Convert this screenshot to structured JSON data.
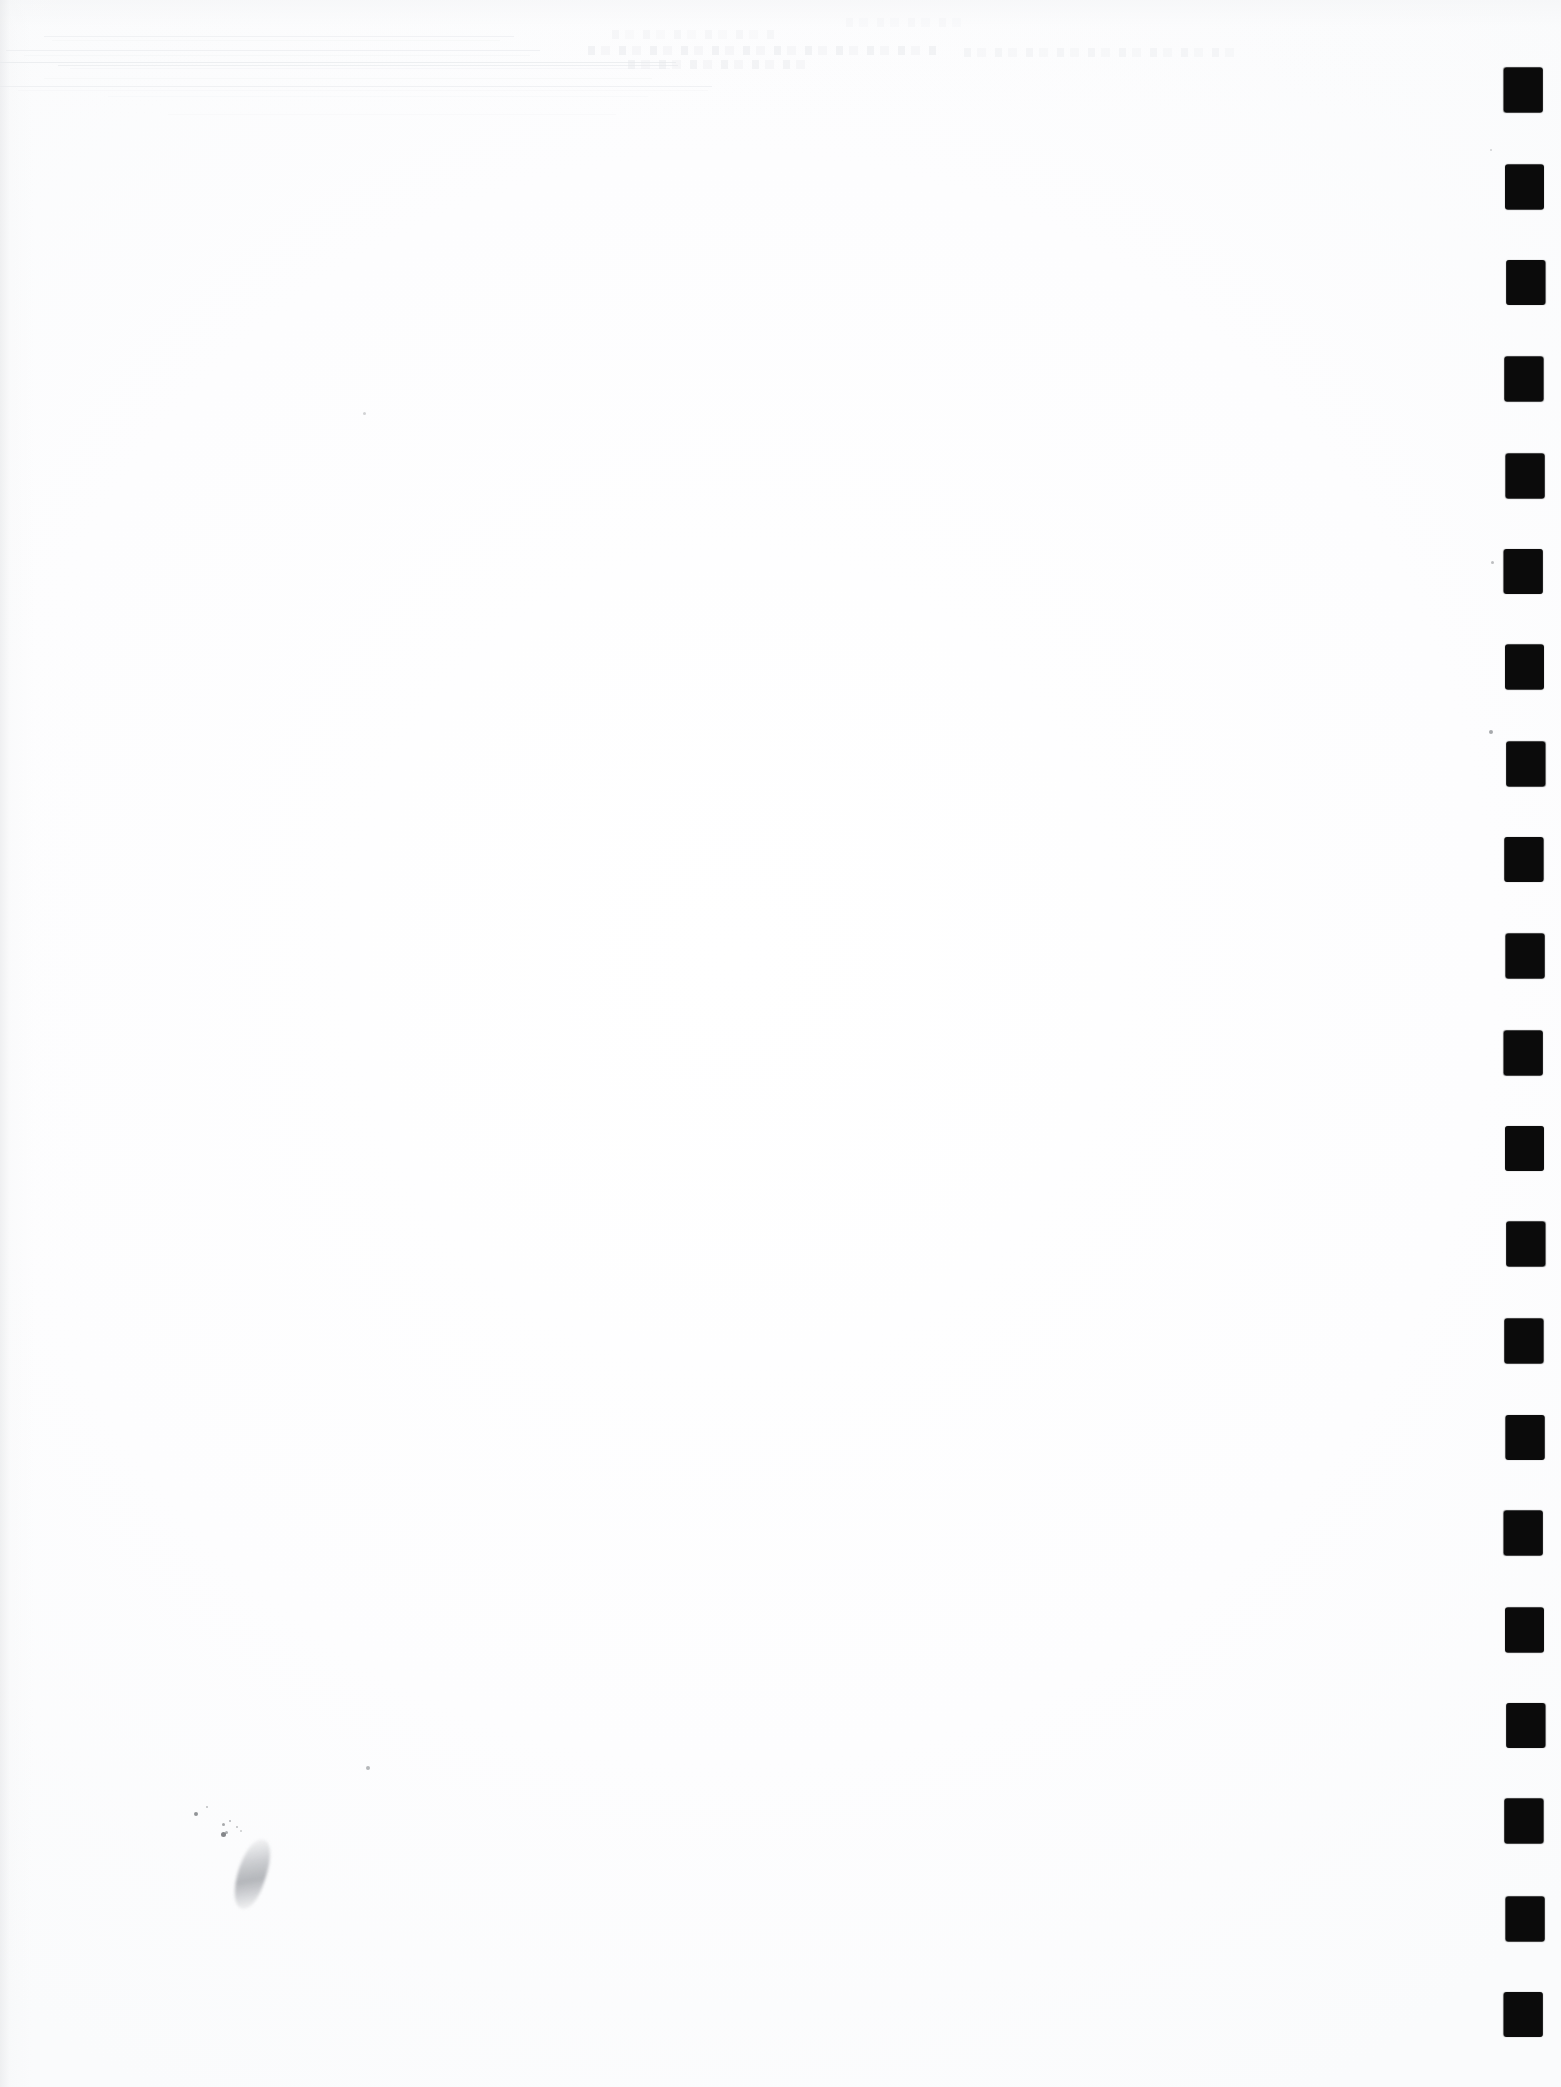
{
  "document": {
    "kind": "scanned-page",
    "title": "Scanned blank page",
    "page_label": "",
    "body_text": "",
    "visible_text": [],
    "background_color": "#fdfdfd",
    "ink_color": "#0b0b0b",
    "width_px": 1561,
    "height_px": 2087
  },
  "fiducial_marks": {
    "name": "right-edge registration marks",
    "count": 21,
    "color": "#0b0b0b",
    "shape": "rounded-square",
    "left_px": 1505,
    "width_px": 39,
    "height_px": 45,
    "pitch_px": 96.1,
    "first_top_px": 68,
    "tops_px": [
      68,
      164,
      260,
      357,
      453,
      549,
      645,
      741,
      837,
      934,
      1030,
      1126,
      1222,
      1318,
      1415,
      1511,
      1607,
      1703,
      1799,
      1896,
      1992
    ]
  },
  "scan_artifacts": {
    "streaks": {
      "name": "horizontal scanner streaks",
      "color": "#eceef0",
      "rows": [
        {
          "top": 36,
          "left": 44,
          "width": 470,
          "opacity": 0.55
        },
        {
          "top": 40,
          "left": 52,
          "width": 448,
          "opacity": 0.45
        },
        {
          "top": 50,
          "left": 6,
          "width": 534,
          "opacity": 0.6
        },
        {
          "top": 55,
          "left": 24,
          "width": 506,
          "opacity": 0.5
        },
        {
          "top": 62,
          "left": 0,
          "width": 676,
          "opacity": 0.75
        },
        {
          "top": 65,
          "left": 58,
          "width": 620,
          "opacity": 0.65
        },
        {
          "top": 68,
          "left": 70,
          "width": 600,
          "opacity": 0.55
        },
        {
          "top": 78,
          "left": 44,
          "width": 608,
          "opacity": 0.45
        },
        {
          "top": 86,
          "left": 0,
          "width": 712,
          "opacity": 0.6
        },
        {
          "top": 90,
          "left": 18,
          "width": 690,
          "opacity": 0.4
        },
        {
          "top": 96,
          "left": 108,
          "width": 540,
          "opacity": 0.35
        },
        {
          "top": 114,
          "left": 168,
          "width": 448,
          "opacity": 0.3
        }
      ]
    },
    "ghost_text": {
      "name": "bleed-through ghost text",
      "description": "illegible reverse-side text showing through the paper",
      "bands": [
        {
          "top": 46,
          "left": 588,
          "width": 352,
          "opacity": 0.55
        },
        {
          "top": 48,
          "left": 964,
          "width": 276,
          "opacity": 0.42
        },
        {
          "top": 60,
          "left": 628,
          "width": 186,
          "opacity": 0.48
        },
        {
          "top": 30,
          "left": 612,
          "width": 162,
          "opacity": 0.3
        },
        {
          "top": 18,
          "left": 846,
          "width": 118,
          "opacity": 0.22
        }
      ]
    },
    "specks": {
      "name": "ink specks and dust",
      "items": [
        {
          "left": 363,
          "top": 412,
          "size": 3,
          "opacity": 0.3
        },
        {
          "left": 366,
          "top": 1766,
          "size": 4,
          "opacity": 0.5
        },
        {
          "left": 194,
          "top": 1812,
          "size": 4,
          "opacity": 0.75
        },
        {
          "left": 206,
          "top": 1806,
          "size": 2,
          "opacity": 0.45
        },
        {
          "left": 222,
          "top": 1823,
          "size": 3,
          "opacity": 0.6
        },
        {
          "left": 229,
          "top": 1820,
          "size": 2,
          "opacity": 0.5
        },
        {
          "left": 236,
          "top": 1826,
          "size": 2,
          "opacity": 0.45
        },
        {
          "left": 225,
          "top": 1831,
          "size": 3,
          "opacity": 0.55
        },
        {
          "left": 221,
          "top": 1832,
          "size": 5,
          "opacity": 0.85
        },
        {
          "left": 240,
          "top": 1830,
          "size": 2,
          "opacity": 0.35
        },
        {
          "left": 1489,
          "top": 730,
          "size": 4,
          "opacity": 0.6
        },
        {
          "left": 1491,
          "top": 561,
          "size": 3,
          "opacity": 0.45
        },
        {
          "left": 1490,
          "top": 149,
          "size": 2,
          "opacity": 0.3
        }
      ]
    },
    "smudge": {
      "name": "pen smudge",
      "left": 238,
      "top": 1838,
      "width": 28,
      "height": 72,
      "rotation_deg": 18
    }
  }
}
